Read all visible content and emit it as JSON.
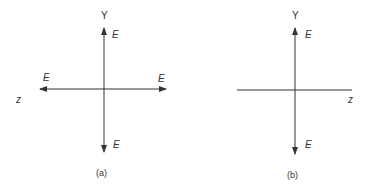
{
  "figures": [
    {
      "id": "a",
      "caption": "(a)",
      "y_axis_label": "Y",
      "z_axis_label": "z",
      "field_labels": {
        "up": "E",
        "down": "E",
        "left": "E",
        "right": "E"
      }
    },
    {
      "id": "b",
      "caption": "(b)",
      "y_axis_label": "Y",
      "z_axis_label": "z",
      "field_labels": {
        "up": "E",
        "down": "E"
      }
    }
  ],
  "colors": {
    "line": "#333333",
    "background": "#ffffff"
  }
}
